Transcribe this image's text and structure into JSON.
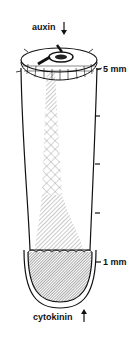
{
  "diagram": {
    "top_label": "auxin",
    "top_arrow": "down-arrow",
    "bottom_label": "cytokinin",
    "bottom_arrow": "up-arrow",
    "scale": {
      "top_tick": "5 mm",
      "bottom_tick": "1 mm",
      "intermediate_ticks": 3
    },
    "colors": {
      "ink": "#111111",
      "hatch": "#777777",
      "background": "#ffffff"
    }
  }
}
